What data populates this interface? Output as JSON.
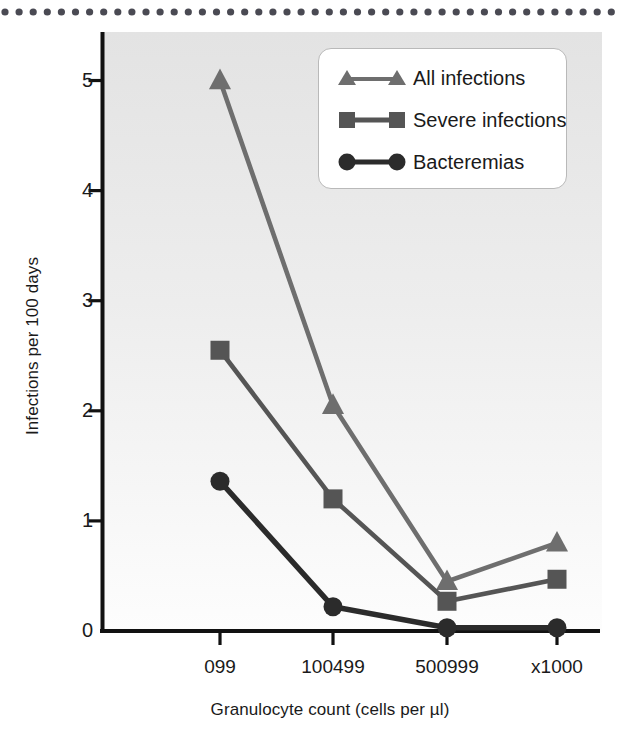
{
  "figure": {
    "top_rule": "dotted-rule",
    "background_note": "light-gray-gradient-plot-area"
  },
  "chart_data": {
    "type": "line",
    "title": "",
    "xlabel": "Granulocyte count (cells per µl)",
    "ylabel": "Infections per 100 days",
    "categories": [
      "0 99",
      "100 499",
      "500 999",
      "x1000"
    ],
    "category_labels_raw": [
      "099",
      "100499",
      "500999",
      "x1000"
    ],
    "yticks": [
      0,
      1,
      2,
      3,
      4,
      5
    ],
    "ytick_labels": [
      "0",
      "1",
      "2",
      "3",
      "4",
      "5"
    ],
    "ylim": [
      0,
      5.25
    ],
    "grid": false,
    "legend_position": "upper right inside",
    "series": [
      {
        "name": "All infections",
        "marker": "triangle",
        "color": "#6e6e6e",
        "values": [
          5.0,
          2.05,
          0.45,
          0.8
        ]
      },
      {
        "name": "Severe infections",
        "marker": "square",
        "color": "#555555",
        "values": [
          2.55,
          1.2,
          0.27,
          0.47
        ]
      },
      {
        "name": "Bacteremias",
        "marker": "circle",
        "color": "#2b2b2b",
        "values": [
          1.36,
          0.22,
          0.03,
          0.03
        ]
      }
    ]
  },
  "colors": {
    "axis": "#111111",
    "rule_dot": "#4a4a53",
    "legend_border": "#b9b9b9",
    "plot_bg_top": "#e6e6e6",
    "plot_bg_bottom": "#ffffff"
  }
}
